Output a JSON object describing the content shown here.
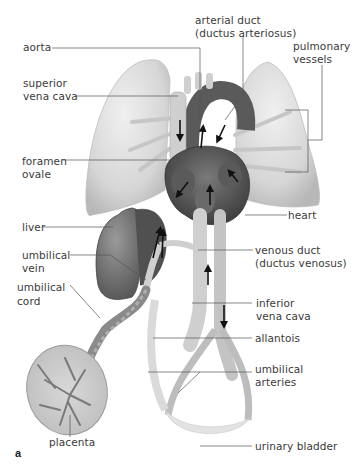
{
  "figure": {
    "panel_letter": "a",
    "colors": {
      "background": "#ffffff",
      "label_text": "#3a3a3a",
      "leader_line": "#555555",
      "lung": "#d9d9d9",
      "heart_dark": "#4a4a4a",
      "vessel": "#cfcfcf",
      "liver": "#6e6e6e",
      "arrow": "#111111"
    },
    "labels": {
      "aorta": "aorta",
      "superior_vena_cava_1": "superior",
      "superior_vena_cava_2": "vena cava",
      "arterial_duct_1": "arterial duct",
      "arterial_duct_2": "(ductus arteriosus)",
      "pulmonary_vessels_1": "pulmonary",
      "pulmonary_vessels_2": "vessels",
      "foramen_ovale_1": "foramen",
      "foramen_ovale_2": "ovale",
      "heart": "heart",
      "liver": "liver",
      "umbilical_vein_1": "umbilical",
      "umbilical_vein_2": "vein",
      "venous_duct_1": "venous duct",
      "venous_duct_2": "(ductus venosus)",
      "umbilical_cord_1": "umbilical",
      "umbilical_cord_2": "cord",
      "inferior_vena_cava_1": "inferior",
      "inferior_vena_cava_2": "vena cava",
      "allantois": "allantois",
      "umbilical_arteries_1": "umbilical",
      "umbilical_arteries_2": "arteries",
      "placenta": "placenta",
      "urinary_bladder": "urinary bladder"
    }
  }
}
